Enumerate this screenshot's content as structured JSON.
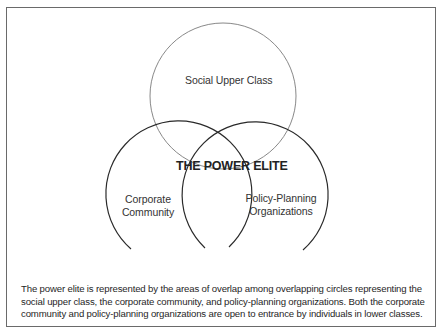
{
  "diagram": {
    "title": "THE POWER ELITE",
    "circles": [
      {
        "id": "social-upper-class",
        "label": "Social Upper Class",
        "cx": 223,
        "cy": 96,
        "r": 73,
        "stroke": "#7a7a7a",
        "closed": true
      },
      {
        "id": "corporate-community",
        "label_line1": "Corporate",
        "label_line2": "Community",
        "cx": 168,
        "cy": 186,
        "r": 73,
        "stroke": "#2a2a2a",
        "closed": false
      },
      {
        "id": "policy-planning-organizations",
        "label_line1": "Policy-Planning",
        "label_line2": "Organizations",
        "cx": 265,
        "cy": 186,
        "r": 73,
        "stroke": "#2a2a2a",
        "closed": false
      }
    ]
  },
  "caption": "The power elite is represented by the areas of overlap among overlapping circles representing the social upper class, the corporate community, and policy-planning organizations. Both the corporate community and policy-planning organizations are open to entrance by individuals in lower classes."
}
